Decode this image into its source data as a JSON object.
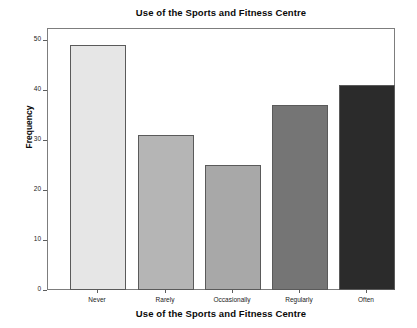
{
  "chart_data": {
    "type": "bar",
    "title": "Use of the Sports and Fitness Centre",
    "xlabel": "Use of the Sports and Fitness Centre",
    "ylabel": "Frequency",
    "categories": [
      "Never",
      "Rarely",
      "Occasionally",
      "Regularly",
      "Often"
    ],
    "values": [
      49,
      31,
      25,
      37,
      41
    ],
    "bar_colors": [
      "#e6e6e6",
      "#b5b5b5",
      "#a8a8a8",
      "#757575",
      "#2b2b2b"
    ],
    "bar_edge_color": "#5a5a5a",
    "ylim": [
      0,
      52.5
    ],
    "yticks": [
      0,
      10,
      20,
      30,
      40,
      50
    ],
    "ytick_labels": [
      "0",
      "10",
      "20",
      "30",
      "40",
      "50"
    ],
    "grid": false,
    "legend": "none",
    "frame_color": "#7d7d7d",
    "background": "#ffffff"
  },
  "axis": {
    "y_tick_0": "0",
    "y_tick_1": "10",
    "y_tick_2": "20",
    "y_tick_3": "30",
    "y_tick_4": "40",
    "y_tick_5": "50",
    "x_cat_0": "Never",
    "x_cat_1": "Rarely",
    "x_cat_2": "Occasionally",
    "x_cat_3": "Regularly",
    "x_cat_4": "Often"
  }
}
